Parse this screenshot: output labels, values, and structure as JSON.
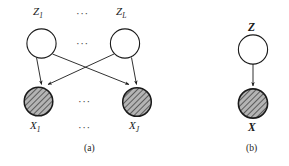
{
  "figure": {
    "kind": "graphical-model-diagram",
    "panels": [
      {
        "id": "a",
        "caption": "(a)",
        "latent_nodes": [
          {
            "label_base": "Z",
            "label_sub": "1",
            "full": "Z1",
            "shaded": false
          },
          {
            "label_base": "Z",
            "label_sub": "L",
            "full": "ZL",
            "shaded": false
          }
        ],
        "observed_nodes": [
          {
            "label_base": "X",
            "label_sub": "1",
            "full": "X1",
            "shaded": true
          },
          {
            "label_base": "X",
            "label_sub": "J",
            "full": "XJ",
            "shaded": true
          }
        ],
        "ellipses": [
          "...",
          "...",
          "...",
          "..."
        ],
        "edges": [
          "Z1 -> X1",
          "Z1 -> XJ",
          "ZL -> X1",
          "ZL -> XJ"
        ]
      },
      {
        "id": "b",
        "caption": "(b)",
        "latent_nodes": [
          {
            "label_base": "Z",
            "label_sub": "",
            "full": "Z",
            "shaded": false
          }
        ],
        "observed_nodes": [
          {
            "label_base": "X",
            "label_sub": "",
            "full": "X",
            "shaded": true
          }
        ],
        "edges": [
          "Z -> X"
        ]
      }
    ]
  },
  "labels": {
    "z1_base": "Z",
    "z1_sub": "1",
    "zL_base": "Z",
    "zL_sub": "L",
    "x1_base": "X",
    "x1_sub": "1",
    "xJ_base": "X",
    "xJ_sub": "J",
    "z_bold": "Z",
    "x_bold": "X"
  },
  "ellipsis": {
    "top": "···",
    "mid_circles": "···",
    "mid_lower": "···",
    "bottom": "···"
  },
  "captions": {
    "panel_a": "(a)",
    "panel_b": "(b)"
  },
  "colors": {
    "stroke": "#1a1a1a",
    "shaded_fill": "#a8a8a8",
    "hatch_line": "#2b2b2b",
    "node_fill": "#ffffff",
    "background": "#ffffff"
  }
}
